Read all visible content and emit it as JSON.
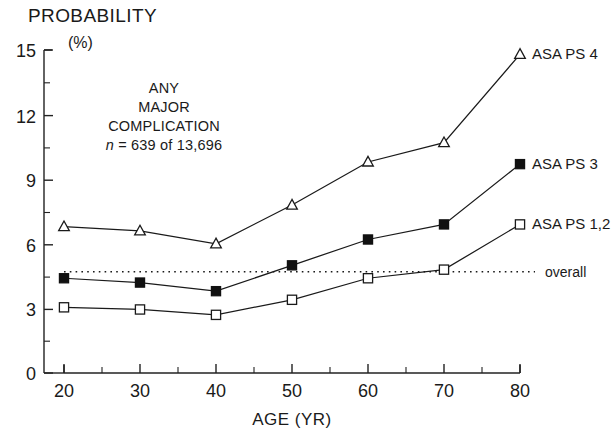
{
  "chart_data": {
    "type": "line",
    "title": "",
    "annotation_lines": [
      "ANY",
      "MAJOR",
      "COMPLICATION"
    ],
    "annotation_n_italic": "n",
    "annotation_n_rest": " = 639 of 13,696",
    "ylabel": "PROBABILITY",
    "yunit": "(%)",
    "xlabel": "AGE (YR)",
    "x": [
      20,
      30,
      40,
      50,
      60,
      70,
      80
    ],
    "xlim": [
      20,
      80
    ],
    "ylim": [
      0,
      15
    ],
    "xticks": [
      20,
      30,
      40,
      50,
      60,
      70,
      80
    ],
    "xtick_labels": [
      "20",
      "30",
      "40",
      "50",
      "60",
      "70",
      "80"
    ],
    "xminor_ticks": [
      25,
      35,
      45,
      55,
      65,
      75
    ],
    "yticks": [
      0,
      3,
      6,
      9,
      12,
      15
    ],
    "ytick_labels": [
      "0",
      "3",
      "6",
      "9",
      "12",
      "15"
    ],
    "yminor_ticks": [
      1.5,
      4.5,
      7.5,
      10.5,
      13.5
    ],
    "grid": false,
    "legend_position": "inline-right",
    "series": [
      {
        "name": "ASA PS 4",
        "label": "ASA PS 4",
        "marker": "open-triangle",
        "values": [
          6.8,
          6.6,
          6.0,
          7.8,
          9.8,
          10.7,
          14.8
        ]
      },
      {
        "name": "ASA PS 3",
        "label": "ASA PS 3",
        "marker": "filled-square",
        "values": [
          4.4,
          4.2,
          3.8,
          5.0,
          6.2,
          6.9,
          9.7
        ]
      },
      {
        "name": "ASA PS 1,2",
        "label": "ASA PS 1,2",
        "marker": "open-square",
        "values": [
          3.05,
          2.95,
          2.7,
          3.4,
          4.4,
          4.8,
          6.9
        ]
      }
    ],
    "reference_line": {
      "name": "overall",
      "label": "overall",
      "value": 4.7,
      "style": "dotted"
    },
    "colors": {
      "ink": "#1a1a1a",
      "background": "#ffffff"
    }
  }
}
